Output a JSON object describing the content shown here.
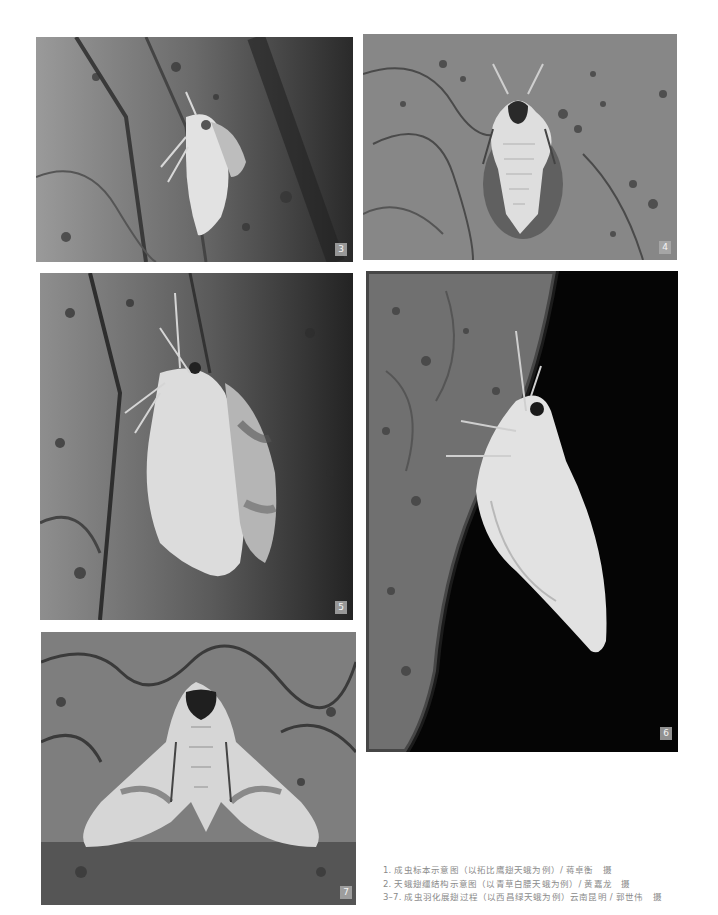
{
  "photos": [
    {
      "id": "3",
      "label": "3",
      "subject": "moth-emerging-from-pupa-side-view"
    },
    {
      "id": "4",
      "label": "4",
      "subject": "moth-emerging-top-view-crumpled-wings"
    },
    {
      "id": "5",
      "label": "5",
      "subject": "moth-wings-expanding-side-view"
    },
    {
      "id": "6",
      "label": "6",
      "subject": "moth-wings-expanded-dark-background"
    },
    {
      "id": "7",
      "label": "7",
      "subject": "moth-wings-fully-spread-top-view"
    }
  ],
  "captions": [
    "1. 成虫标本示意图（以拓比鹰翅天蛾为例）/ 蒋卓衡　摄",
    "2. 天蛾翅缰结构示意图（以青草白腰天蛾为例）/ 黄嘉龙　摄",
    "3–7. 成虫羽化展翅过程（以西昌绿天蛾为例）云南昆明 / 郭世伟　摄"
  ],
  "colors": {
    "page_background": "#ffffff",
    "caption_text": "#8a8a8a",
    "badge_background": "#aaaaaa"
  }
}
